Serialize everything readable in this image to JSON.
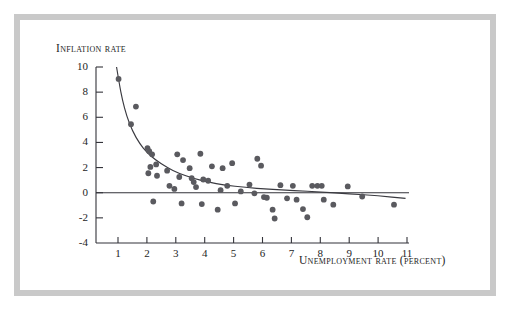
{
  "figure": {
    "frame_color": "#c9c9c9",
    "background": "#ffffff",
    "ink_color": "#33333a",
    "point_color": "#5a5a5f"
  },
  "chart_data": {
    "type": "scatter",
    "title": "",
    "xlabel": "Unemployment rate (percent)",
    "ylabel": "Inflation rate",
    "xlim": [
      0.5,
      11.0
    ],
    "ylim": [
      -4,
      10
    ],
    "xticks": [
      1,
      2,
      3,
      4,
      5,
      6,
      7,
      8,
      9,
      10,
      11
    ],
    "xtick_labels": [
      "1",
      "2",
      "3",
      "4",
      "5",
      "6",
      "7",
      "8",
      "9",
      "10",
      "11"
    ],
    "yticks": [
      -4,
      -2,
      0,
      2,
      4,
      6,
      8,
      10
    ],
    "ytick_labels": [
      "-4",
      "-2",
      "0",
      "2",
      "4",
      "6",
      "8",
      "10"
    ],
    "grid": false,
    "legend": null,
    "zero_line": 0,
    "points": [
      [
        1.02,
        9.05
      ],
      [
        1.62,
        6.85
      ],
      [
        1.45,
        5.45
      ],
      [
        2.02,
        3.55
      ],
      [
        2.08,
        3.3
      ],
      [
        2.18,
        3.05
      ],
      [
        2.12,
        2.05
      ],
      [
        2.32,
        2.25
      ],
      [
        2.05,
        1.55
      ],
      [
        2.35,
        1.35
      ],
      [
        2.22,
        -0.7
      ],
      [
        2.7,
        1.75
      ],
      [
        2.78,
        0.55
      ],
      [
        2.95,
        0.3
      ],
      [
        3.05,
        3.05
      ],
      [
        3.25,
        2.6
      ],
      [
        3.12,
        1.25
      ],
      [
        3.2,
        -0.85
      ],
      [
        3.48,
        1.95
      ],
      [
        3.55,
        1.15
      ],
      [
        3.62,
        0.85
      ],
      [
        3.7,
        0.45
      ],
      [
        3.85,
        3.1
      ],
      [
        3.95,
        1.05
      ],
      [
        3.9,
        -0.9
      ],
      [
        4.12,
        0.95
      ],
      [
        4.25,
        2.1
      ],
      [
        4.45,
        -1.35
      ],
      [
        4.55,
        0.2
      ],
      [
        4.62,
        1.95
      ],
      [
        4.78,
        0.55
      ],
      [
        4.95,
        2.35
      ],
      [
        5.05,
        -0.85
      ],
      [
        5.25,
        0.1
      ],
      [
        5.55,
        0.65
      ],
      [
        5.72,
        -0.05
      ],
      [
        5.82,
        2.7
      ],
      [
        5.95,
        2.15
      ],
      [
        6.05,
        -0.35
      ],
      [
        6.15,
        -0.4
      ],
      [
        6.35,
        -1.35
      ],
      [
        6.42,
        -2.05
      ],
      [
        6.62,
        0.6
      ],
      [
        6.85,
        -0.45
      ],
      [
        7.05,
        0.55
      ],
      [
        7.18,
        -0.55
      ],
      [
        7.4,
        -1.3
      ],
      [
        7.55,
        -1.95
      ],
      [
        7.72,
        0.55
      ],
      [
        7.9,
        0.55
      ],
      [
        8.05,
        0.55
      ],
      [
        8.12,
        -0.55
      ],
      [
        8.45,
        -0.95
      ],
      [
        8.95,
        0.5
      ],
      [
        9.45,
        -0.3
      ],
      [
        10.55,
        -0.95
      ]
    ],
    "fit_curve": {
      "label": "fitted Phillips curve",
      "points": [
        [
          0.95,
          10.0
        ],
        [
          1.05,
          8.6
        ],
        [
          1.15,
          7.4
        ],
        [
          1.3,
          6.1
        ],
        [
          1.5,
          4.9
        ],
        [
          1.75,
          3.9
        ],
        [
          2.0,
          3.2
        ],
        [
          2.3,
          2.6
        ],
        [
          2.7,
          2.0
        ],
        [
          3.1,
          1.55
        ],
        [
          3.6,
          1.15
        ],
        [
          4.1,
          0.85
        ],
        [
          4.7,
          0.6
        ],
        [
          5.4,
          0.42
        ],
        [
          6.2,
          0.28
        ],
        [
          7.1,
          0.18
        ],
        [
          8.0,
          0.06
        ],
        [
          9.0,
          -0.08
        ],
        [
          10.0,
          -0.25
        ],
        [
          10.95,
          -0.45
        ]
      ]
    }
  }
}
